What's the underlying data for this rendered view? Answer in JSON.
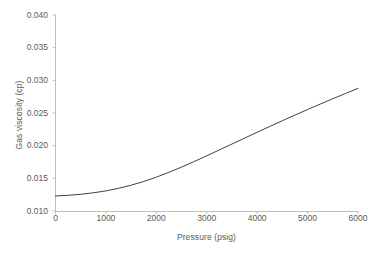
{
  "chart_data": {
    "type": "line",
    "title": "",
    "xlabel": "Pressure (psig)",
    "ylabel": "Gas viscosity (cp)",
    "xlim": [
      0,
      6000
    ],
    "ylim": [
      0.01,
      0.04
    ],
    "xticks": [
      0,
      1000,
      2000,
      3000,
      4000,
      5000,
      6000
    ],
    "xtick_labels": [
      "0",
      "1000",
      "2000",
      "3000",
      "4000",
      "5000",
      "6000"
    ],
    "yticks": [
      0.01,
      0.015,
      0.02,
      0.025,
      0.03,
      0.035,
      0.04
    ],
    "ytick_labels": [
      "0.010",
      "0.015",
      "0.020",
      "0.025",
      "0.030",
      "0.035",
      "0.040"
    ],
    "grid": false,
    "legend": false,
    "series": [
      {
        "name": "Gas viscosity",
        "color": "#404040",
        "line_width": 1,
        "x": [
          0,
          250,
          500,
          750,
          1000,
          1250,
          1500,
          1750,
          2000,
          2250,
          2500,
          2750,
          3000,
          3250,
          3500,
          3750,
          4000,
          4250,
          4500,
          4750,
          5000,
          5250,
          5500,
          5750,
          6000
        ],
        "y": [
          0.0123,
          0.0124,
          0.01256,
          0.01278,
          0.01308,
          0.01347,
          0.01395,
          0.01452,
          0.01518,
          0.01592,
          0.01672,
          0.01757,
          0.01845,
          0.01935,
          0.02025,
          0.02115,
          0.02205,
          0.02294,
          0.02382,
          0.02468,
          0.02553,
          0.02636,
          0.02718,
          0.02798,
          0.02877
        ]
      }
    ],
    "data_table": {
      "columns": [
        "Pressure (psig)",
        "Gas viscosity (cp)"
      ],
      "rows": [
        [
          "0",
          "0.0123"
        ],
        [
          "1000",
          "0.0129"
        ],
        [
          "2000",
          "0.0159"
        ],
        [
          "3000",
          "0.0212"
        ],
        [
          "4000",
          "0.0268"
        ],
        [
          "5000",
          "0.0321"
        ],
        [
          "6000",
          "0.0370"
        ]
      ]
    }
  },
  "style": {
    "background": "#ffffff",
    "axis_color": "#bfbfbf",
    "text_color": "#5a5a5a",
    "line_color": "#404040"
  }
}
